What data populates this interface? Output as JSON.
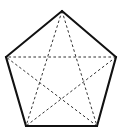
{
  "figure": {
    "shape_name": "pentagon",
    "inner_shape_name": "pentagram",
    "canvas": {
      "width": 122,
      "height": 136,
      "background_color": "#ffffff"
    },
    "colors": {
      "edge_color": "#111111",
      "diagonal_color": "#333333",
      "fill_color": "none",
      "background_color": "#ffffff"
    },
    "edge_style": {
      "stroke_width": 2.1,
      "dash": "none",
      "linejoin": "miter"
    },
    "diagonal_style": {
      "stroke_width": 1.0,
      "dash": "2.6 2.4"
    },
    "vertices": [
      {
        "id": "A",
        "label": "apex",
        "x": 62,
        "y": 11
      },
      {
        "id": "B",
        "label": "right",
        "x": 116,
        "y": 57
      },
      {
        "id": "C",
        "label": "bottom-right",
        "x": 97,
        "y": 126
      },
      {
        "id": "D",
        "label": "bottom-left",
        "x": 26,
        "y": 126
      },
      {
        "id": "E",
        "label": "left",
        "x": 6,
        "y": 57
      }
    ],
    "edges": [
      {
        "from": "A",
        "to": "B"
      },
      {
        "from": "B",
        "to": "C"
      },
      {
        "from": "C",
        "to": "D"
      },
      {
        "from": "D",
        "to": "E"
      },
      {
        "from": "E",
        "to": "A"
      }
    ],
    "diagonals": [
      {
        "from": "A",
        "to": "C"
      },
      {
        "from": "A",
        "to": "D"
      },
      {
        "from": "B",
        "to": "D"
      },
      {
        "from": "B",
        "to": "E"
      },
      {
        "from": "C",
        "to": "E"
      }
    ]
  }
}
